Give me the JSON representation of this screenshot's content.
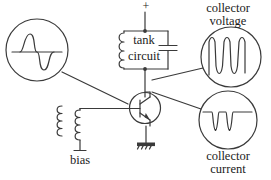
{
  "diagram": {
    "stroke_color": "#3a3a3a",
    "text_color": "#1b1b1b",
    "background": "#ffffff"
  },
  "labels": {
    "supply_plus": "+",
    "tank_line1": "tank",
    "tank_line2": "circuit",
    "bias": "bias",
    "collector_voltage_line1": "collector",
    "collector_voltage_line2": "voltage",
    "collector_current_line1": "collector",
    "collector_current_line2": "current"
  },
  "components": {
    "transistor": "npn-transistor",
    "inductor": "tank-inductor",
    "capacitor": "tank-capacitor",
    "transformer": "bias-transformer",
    "ground": "chassis-ground"
  },
  "scopes": [
    {
      "name": "base-signal-scope",
      "waveform": "sine",
      "cycles": 1,
      "has_baseline": true,
      "cx": 37,
      "cy": 50,
      "r": 31
    },
    {
      "name": "collector-voltage-scope",
      "waveform": "clipped-sine-dips",
      "cycles": 2,
      "has_baseline": false,
      "cx": 231,
      "cy": 57,
      "r": 30
    },
    {
      "name": "collector-current-scope",
      "waveform": "narrow-current-pulses",
      "cycles": 2,
      "has_baseline": false,
      "cx": 228,
      "cy": 120,
      "r": 29
    }
  ]
}
